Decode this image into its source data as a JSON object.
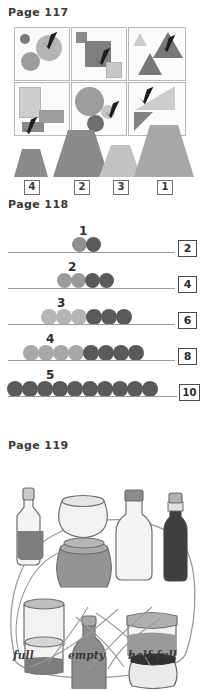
{
  "pages": [
    {
      "id": "page-117",
      "title": "Page 117",
      "exercise": "circle-the-biggest-shape",
      "grid": {
        "cells": [
          {
            "index": 1,
            "shape": "circle",
            "checked_item": "large-light-circle",
            "items": [
              "small-dark-circle",
              "large-light-circle",
              "medium-gray-circle"
            ]
          },
          {
            "index": 2,
            "shape": "square",
            "checked_item": "large-dark-square",
            "items": [
              "small-dark-square",
              "large-dark-square",
              "small-light-square"
            ]
          },
          {
            "index": 3,
            "shape": "triangle",
            "checked_item": "large-dark-triangle",
            "items": [
              "small-light-triangle",
              "large-dark-triangle",
              "medium-dark-triangle"
            ]
          },
          {
            "index": 4,
            "shape": "rectangle",
            "checked_item": "small-dark-rectangle",
            "items": [
              "tall-light-rectangle",
              "wide-gray-rectangle",
              "small-dark-rectangle"
            ]
          },
          {
            "index": 5,
            "shape": "circle",
            "checked_item": "small-light-circle",
            "items": [
              "large-gray-circle",
              "small-light-circle",
              "medium-dark-circle"
            ]
          },
          {
            "index": 6,
            "shape": "right-triangle",
            "checked_item": "large-light-right-triangle",
            "items": [
              "large-light-right-triangle",
              "small-dark-right-triangle"
            ]
          }
        ]
      },
      "trapezoids": {
        "instruction": "order-by-size",
        "items": [
          {
            "label": "4",
            "rank": 4,
            "width": 34,
            "height": 28,
            "top_ratio": 0.55,
            "color": "#8a8a8a"
          },
          {
            "label": "2",
            "rank": 2,
            "width": 56,
            "height": 47,
            "top_ratio": 0.52,
            "color": "#8a8a8a"
          },
          {
            "label": "3",
            "rank": 3,
            "width": 42,
            "height": 32,
            "top_ratio": 0.6,
            "color": "#c2c2c2"
          },
          {
            "label": "1",
            "rank": 1,
            "width": 60,
            "height": 52,
            "top_ratio": 0.55,
            "color": "#a8a8a8"
          }
        ]
      }
    },
    {
      "id": "page-118",
      "title": "Page 118",
      "exercise": "count-the-beads",
      "rows": [
        {
          "row_label": "1",
          "light": 1,
          "dark": 1,
          "answer": "2",
          "light_color": "#8f8f8f",
          "dark_color": "#5a5a5a"
        },
        {
          "row_label": "2",
          "light": 2,
          "dark": 2,
          "answer": "4",
          "light_color": "#9a9a9a",
          "dark_color": "#5a5a5a"
        },
        {
          "row_label": "3",
          "light": 3,
          "dark": 3,
          "answer": "6",
          "light_color": "#b5b5b5",
          "dark_color": "#5a5a5a"
        },
        {
          "row_label": "4",
          "light": 4,
          "dark": 4,
          "answer": "8",
          "light_color": "#a8a8a8",
          "dark_color": "#5a5a5a"
        },
        {
          "row_label": "5",
          "light": 0,
          "dark": 10,
          "answer": "10",
          "light_color": "#a8a8a8",
          "dark_color": "#5a5a5a"
        }
      ]
    },
    {
      "id": "page-119",
      "title": "Page 119",
      "exercise": "match-the-containers",
      "labels": [
        {
          "key": "full",
          "text": "full"
        },
        {
          "key": "empty",
          "text": "empty"
        },
        {
          "key": "half-full",
          "text": "half-full"
        }
      ],
      "containers": [
        {
          "name": "tall-decanter",
          "state": "half-full"
        },
        {
          "name": "round-bowl",
          "state": "empty"
        },
        {
          "name": "wide-jar",
          "state": "full"
        },
        {
          "name": "clear-bottle",
          "state": "empty"
        },
        {
          "name": "dark-slim-bottle",
          "state": "full"
        },
        {
          "name": "short-jar",
          "state": "empty"
        },
        {
          "name": "low-jar",
          "state": "half-full"
        },
        {
          "name": "grey-bottle",
          "state": "full"
        },
        {
          "name": "lidded-jar",
          "state": "half-full"
        },
        {
          "name": "ribbed-jar",
          "state": "empty"
        }
      ]
    }
  ],
  "colors": {
    "ink": "#3b3b3b",
    "outline": "#6e6e6e",
    "bead_dark": "#5a5a5a",
    "bead_light": "#a8a8a8",
    "line": "#9a9aa5",
    "shape_dark": "#6e6e6e",
    "shape_mid": "#9d9d9d",
    "shape_light": "#cfcfcf",
    "liquid": "#7d7d7d"
  }
}
